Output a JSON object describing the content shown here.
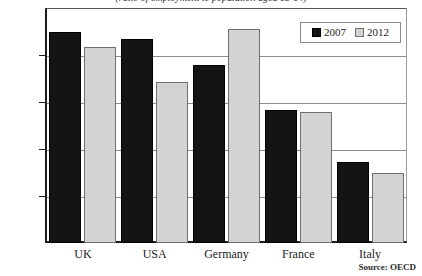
{
  "caption": "(ratio of employment to population aged 15-64)",
  "source_note": "Source: OECD",
  "legend": {
    "position": "top-right",
    "entries": [
      {
        "label": "2007",
        "color": "#141414"
      },
      {
        "label": "2012",
        "color": "#d3d3d3"
      }
    ]
  },
  "chart_data": {
    "type": "bar",
    "title": "",
    "subtitle": "(ratio of employment to population aged 15-64)",
    "xlabel": "",
    "ylabel": "",
    "categories": [
      "UK",
      "USA",
      "Germany",
      "France",
      "Italy"
    ],
    "series": [
      {
        "name": "2007",
        "color": "#141414",
        "values": [
          72.4,
          71.7,
          68.9,
          64.1,
          58.6
        ]
      },
      {
        "name": "2012",
        "color": "#d3d3d3",
        "values": [
          70.8,
          67.1,
          72.8,
          63.9,
          57.5
        ]
      }
    ],
    "ylim": [
      50.0,
      75.0
    ],
    "yticks": [
      50.0,
      55.0,
      60.0,
      65.0,
      70.0,
      75.0
    ],
    "ytick_labels": [
      "50.0",
      "55.0",
      "60.0",
      "65.0",
      "70.0",
      "75.0"
    ],
    "grid": true,
    "grid_axis": "y",
    "legend_position": "top-right",
    "source": "Source: OECD"
  }
}
